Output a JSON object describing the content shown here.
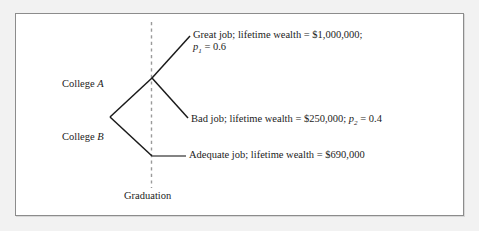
{
  "diagram": {
    "type": "decision-tree",
    "nodes": {
      "root_label_a": "College A",
      "root_label_b": "College B"
    },
    "axis": {
      "divider_label": "Graduation"
    },
    "outcomes": [
      {
        "id": "great-job",
        "line1": "Great job; lifetime wealth = $1,000,000;",
        "prob_symbol": "p",
        "prob_subscript": "1",
        "prob_equals": " = 0.6",
        "wealth": "$1,000,000",
        "probability": 0.6
      },
      {
        "id": "bad-job",
        "text_before": "Bad job; lifetime wealth = $250,000; ",
        "prob_symbol": "p",
        "prob_subscript": "2",
        "prob_equals": " = 0.4",
        "wealth": "$250,000",
        "probability": 0.4
      },
      {
        "id": "adequate-job",
        "text": "Adequate job; lifetime wealth = $690,000",
        "wealth": "$690,000"
      }
    ],
    "colors": {
      "page_background": "#f2f2f2",
      "card_background": "#ffffff",
      "card_border": "#8c8c8c",
      "branch_stroke": "#1a1a1a",
      "divider_stroke": "#9a9a9a",
      "leader_stroke": "#5a5a5a",
      "text": "#1c1c1c"
    }
  }
}
